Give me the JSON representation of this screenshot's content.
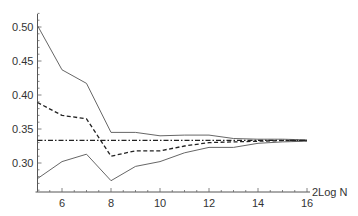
{
  "chart_data": {
    "type": "line",
    "title": "",
    "xlabel": "2Log N",
    "ylabel": "",
    "xlim": [
      5,
      16
    ],
    "ylim": [
      0.257,
      0.52
    ],
    "grid": false,
    "legend": null,
    "x_ticks": [
      6,
      8,
      10,
      12,
      14,
      16
    ],
    "x_tick_labels": [
      "6",
      "8",
      "10",
      "12",
      "14",
      "16"
    ],
    "y_ticks": [
      0.3,
      0.35,
      0.4,
      0.45,
      0.5
    ],
    "y_tick_labels": [
      "0.30",
      "0.35",
      "0.40",
      "0.45",
      "0.50"
    ],
    "x": [
      5,
      6,
      7,
      8,
      9,
      10,
      11,
      12,
      13,
      14,
      15,
      16
    ],
    "series": [
      {
        "name": "upper bound",
        "style": "solid-thin",
        "values": [
          0.502,
          0.437,
          0.417,
          0.345,
          0.345,
          0.34,
          0.341,
          0.341,
          0.336,
          0.335,
          0.335,
          0.334
        ]
      },
      {
        "name": "estimate",
        "style": "dashed",
        "values": [
          0.389,
          0.37,
          0.365,
          0.31,
          0.318,
          0.318,
          0.325,
          0.33,
          0.331,
          0.332,
          0.333,
          0.333
        ]
      },
      {
        "name": "lower bound",
        "style": "solid-thin",
        "values": [
          0.277,
          0.302,
          0.313,
          0.274,
          0.295,
          0.302,
          0.315,
          0.323,
          0.323,
          0.329,
          0.331,
          0.332
        ]
      },
      {
        "name": "reference 1/3",
        "style": "dash-dot",
        "values": [
          0.3333,
          0.3333,
          0.3333,
          0.3333,
          0.3333,
          0.3333,
          0.3333,
          0.3333,
          0.3333,
          0.3333,
          0.3333,
          0.3333
        ]
      }
    ]
  }
}
